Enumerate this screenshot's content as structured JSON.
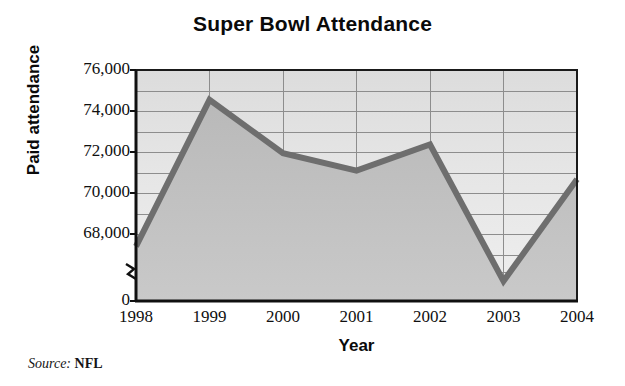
{
  "chart_data": {
    "type": "area",
    "title": "Super Bowl Attendance",
    "xlabel": "Year",
    "ylabel": "Paid attendance",
    "categories": [
      "1998",
      "1999",
      "2000",
      "2001",
      "2002",
      "2003",
      "2004"
    ],
    "values": [
      68900,
      74800,
      72650,
      71950,
      73000,
      67500,
      71600
    ],
    "series": [
      {
        "name": "Paid attendance",
        "values": [
          68900,
          74800,
          72650,
          71950,
          73000,
          67500,
          71600
        ]
      }
    ],
    "ylim": [
      0,
      76000
    ],
    "y_ticks": [
      "76,000",
      "74,000",
      "72,000",
      "70,000",
      "68,000",
      "0"
    ],
    "y_tick_values": [
      76000,
      74000,
      72000,
      70000,
      68000,
      0
    ],
    "x_ticks": [
      "1998",
      "1999",
      "2000",
      "2001",
      "2002",
      "2003",
      "2004"
    ],
    "axis_break": true,
    "axis_break_note": "y-axis broken between 0 and the 68,000 band",
    "grid": true,
    "legend": false,
    "legend_position": "none",
    "source_label": "Source:",
    "source_value": "NFL",
    "colors": {
      "line": "#6e6e6e",
      "area_upper": "#d5d5d5",
      "area_lower": "#b4b4b4",
      "plot_background": "#e2e2e2",
      "grid": "#8f8f8f",
      "axis": "#1a1a1a",
      "text": "#101010"
    }
  }
}
